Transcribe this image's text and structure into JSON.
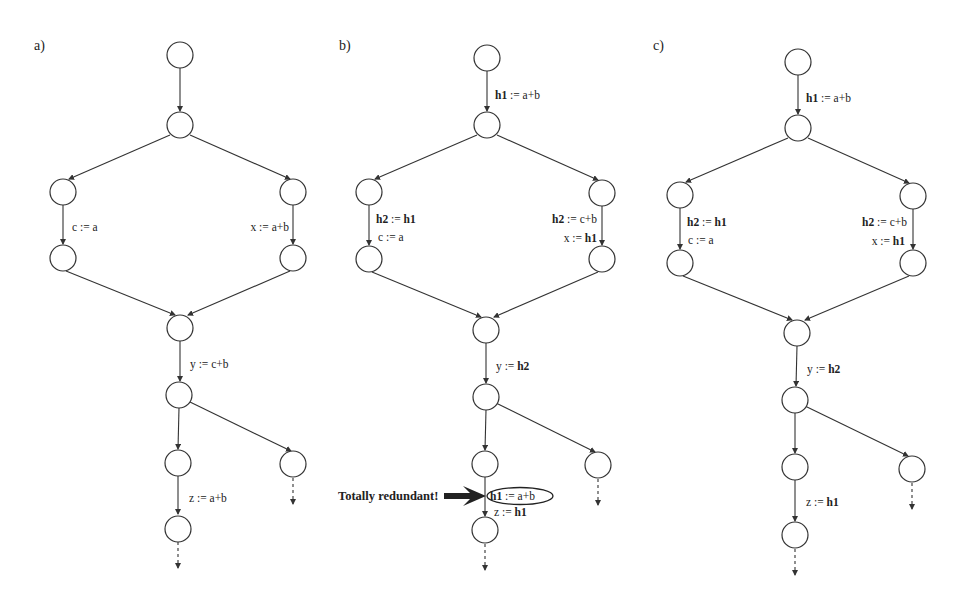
{
  "figure": {
    "panels": [
      {
        "label": "a)",
        "edges": {
          "top": "",
          "left_branch": "c := a",
          "right_branch": "x := a+b",
          "merge_out": "y := c+b",
          "lower": "z := a+b"
        }
      },
      {
        "label": "b)",
        "edges": {
          "top_var": "h1",
          "top_rest": " := a+b",
          "left_branch_1_var": "h2",
          "left_branch_1_rest": " := ",
          "left_branch_1_val": "h1",
          "left_branch_2": "c := a",
          "right_branch_1_var": "h2",
          "right_branch_1_rest": " := c+b",
          "right_branch_2_rest": "x := ",
          "right_branch_2_val": "h1",
          "merge_out_rest": "y := ",
          "merge_out_val": "h2",
          "lower_1_var": "h1",
          "lower_1_rest": " := a+b",
          "lower_2_rest": "z := ",
          "lower_2_val": "h1"
        },
        "annotation": "Totally redundant!"
      },
      {
        "label": "c)",
        "edges": {
          "top_var": "h1",
          "top_rest": " := a+b",
          "left_branch_1_var": "h2",
          "left_branch_1_rest": " := ",
          "left_branch_1_val": "h1",
          "left_branch_2": "c := a",
          "right_branch_1_var": "h2",
          "right_branch_1_rest": " := c+b",
          "right_branch_2_rest": "x := ",
          "right_branch_2_val": "h1",
          "merge_out_rest": "y := ",
          "merge_out_val": "h2",
          "lower_rest": "z := ",
          "lower_val": "h1"
        }
      }
    ],
    "colors": {
      "stroke": "#333333",
      "text": "#222222",
      "background": "#ffffff"
    }
  }
}
